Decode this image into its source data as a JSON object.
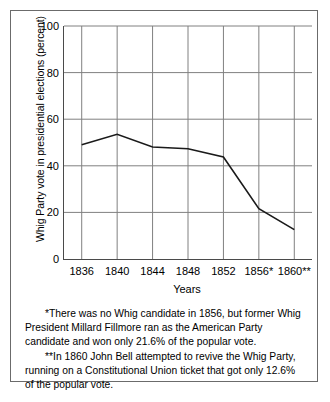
{
  "chart_data": {
    "type": "line",
    "title": "",
    "xlabel": "Years",
    "ylabel": "Whig Party vote in presidential elections (percent)",
    "categories": [
      "1836",
      "1840",
      "1844",
      "1848",
      "1852",
      "1856*",
      "1860**"
    ],
    "x": [
      1836,
      1840,
      1844,
      1848,
      1852,
      1856,
      1860
    ],
    "values": [
      49.0,
      53.5,
      48.1,
      47.3,
      43.8,
      21.6,
      12.6
    ],
    "series": [
      {
        "name": "Whig Party vote",
        "values": [
          49.0,
          53.5,
          48.1,
          47.3,
          43.8,
          21.6,
          12.6
        ]
      }
    ],
    "ylim": [
      0,
      100
    ],
    "yticks": [
      0,
      20,
      40,
      60,
      80,
      100
    ],
    "ytick_labels": [
      "0",
      "20",
      "40",
      "60",
      "80",
      "100"
    ],
    "grid": "both",
    "legend": "none",
    "line_color": "#1a1a1a",
    "grid_color": "#808080",
    "axis_color": "#4a4a4a"
  },
  "notes": {
    "footnote_1": "*There was no Whig candidate in 1856, but former Whig President Millard Fillmore ran as the American Party candidate and won only 21.6% of the popular vote.",
    "footnote_2": "**In 1860 John Bell attempted to revive the Whig Party, running on a Constitutional Union ticket that got only 12.6% of the popular vote."
  }
}
